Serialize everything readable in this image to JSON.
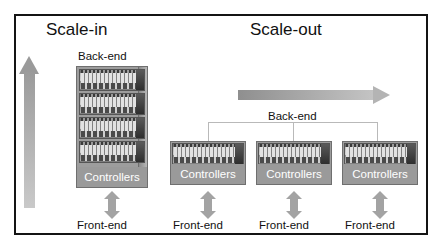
{
  "diagram": {
    "title_left": "Scale-in",
    "title_right": "Scale-out",
    "backend_label_left": "Back-end",
    "backend_label_right": "Back-end",
    "controllers_label": "Controllers",
    "frontend_label": "Front-end",
    "colors": {
      "frame_border": "#141414",
      "arrow_gray": "#a3a3a3",
      "rack_body": "#9d9d9d",
      "controllers_band": "#9a9a9a",
      "bracket_line": "#b9b9b9",
      "text": "#111111",
      "controllers_text": "#ffffff",
      "background": "#ffffff"
    },
    "scale_in": {
      "backend_label": "Back-end",
      "rack": {
        "controllers_label": "Controllers",
        "chassis_count": 4
      },
      "frontend_label": "Front-end"
    },
    "scale_out": {
      "backend_label": "Back-end",
      "units": [
        {
          "controllers_label": "Controllers",
          "frontend_label": "Front-end"
        },
        {
          "controllers_label": "Controllers",
          "frontend_label": "Front-end"
        },
        {
          "controllers_label": "Controllers",
          "frontend_label": "Front-end"
        }
      ]
    }
  }
}
